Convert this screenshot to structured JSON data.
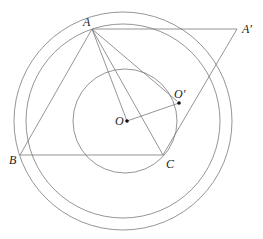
{
  "diagram": {
    "type": "geometry",
    "points": {
      "A": {
        "label": "A",
        "x": 92,
        "y": 29
      },
      "A_prime": {
        "label": "A'",
        "x": 237,
        "y": 29
      },
      "B": {
        "label": "B",
        "x": 20,
        "y": 155
      },
      "C": {
        "label": "C",
        "x": 163,
        "y": 155
      },
      "O": {
        "label": "O",
        "x": 127,
        "y": 121
      },
      "O_prime": {
        "label": "O'",
        "x": 179,
        "y": 103
      }
    },
    "circles": [
      {
        "name": "outer-circle",
        "cx": 123,
        "cy": 121,
        "r": 109
      },
      {
        "name": "middle-circle",
        "cx": 123,
        "cy": 121,
        "r": 97
      },
      {
        "name": "inner-circle",
        "cx": 125,
        "cy": 121,
        "r": 52
      }
    ],
    "segments": [
      [
        "A",
        "A_prime"
      ],
      [
        "A",
        "B"
      ],
      [
        "A",
        "C"
      ],
      [
        "A",
        "O"
      ],
      [
        "A",
        "O_prime"
      ],
      [
        "B",
        "C"
      ],
      [
        "A_prime",
        "C"
      ],
      [
        "O",
        "O_prime"
      ]
    ],
    "colors": {
      "line": "#7a7a7a",
      "text": "#222222",
      "point": "#111111"
    }
  }
}
